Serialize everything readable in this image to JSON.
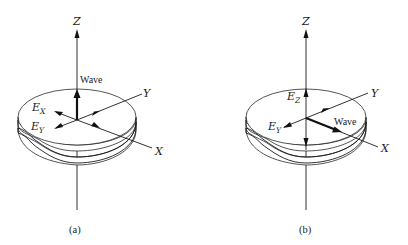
{
  "figure": {
    "panels": [
      {
        "id": "a",
        "caption": "(a)",
        "axes": {
          "z": "Z",
          "y": "Y",
          "x": "X"
        },
        "wave_label": "Wave",
        "wave_direction": "along Z (normal to surface)",
        "field_components": [
          {
            "symbol": "E",
            "subscript": "X"
          },
          {
            "symbol": "E",
            "subscript": "Y"
          }
        ]
      },
      {
        "id": "b",
        "caption": "(b)",
        "axes": {
          "z": "Z",
          "y": "Y",
          "x": "X"
        },
        "wave_label": "Wave",
        "wave_direction": "along X (parallel to surface)",
        "field_components": [
          {
            "symbol": "E",
            "subscript": "Z"
          },
          {
            "symbol": "E",
            "subscript": "Y"
          }
        ]
      }
    ],
    "colors": {
      "line": "#1a1a1a",
      "background": "#ffffff"
    }
  }
}
